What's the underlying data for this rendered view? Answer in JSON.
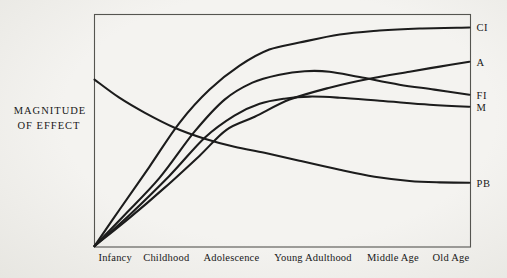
{
  "figure": {
    "bg_color": "#f3f2ef",
    "curve_color": "#1c1c1c",
    "box_color": "#555550",
    "text_color": "#181818"
  },
  "y_axis": {
    "line1": "MAGNITUDE",
    "line2": "OF EFFECT"
  },
  "x_axis": {
    "labels": [
      {
        "text": "Infancy",
        "x": 5.5
      },
      {
        "text": "Childhood",
        "x": 19.1
      },
      {
        "text": "Adolescence",
        "x": 36.4
      },
      {
        "text": "Young Adulthood",
        "x": 58.1
      },
      {
        "text": "Middle Age",
        "x": 79.4
      },
      {
        "text": "Old Age",
        "x": 94.8
      }
    ]
  },
  "chart_data": {
    "type": "line",
    "title": "",
    "ylabel": "MAGNITUDE OF EFFECT",
    "x_categories": [
      "Infancy",
      "Childhood",
      "Adolescence",
      "Young Adulthood",
      "Middle Age",
      "Old Age"
    ],
    "axes_numeric": false,
    "x_range": [
      0,
      100
    ],
    "y_range": [
      0,
      100
    ],
    "x_note": "0-100 = relative position across the life span (Infancy to Old Age)",
    "y_note": "0-100 = relative magnitude of effect (no numeric scale printed)",
    "grid": false,
    "legend_position": "curve-end labels at right margin",
    "series": [
      {
        "name": "CI",
        "points": [
          [
            0,
            0.4
          ],
          [
            6.6,
            15.9
          ],
          [
            14.6,
            34.5
          ],
          [
            22.6,
            53.4
          ],
          [
            30.6,
            67.7
          ],
          [
            38.6,
            78.0
          ],
          [
            46.5,
            84.9
          ],
          [
            54.5,
            87.9
          ],
          [
            65.2,
            91.4
          ],
          [
            75.8,
            93.1
          ],
          [
            86.4,
            94.0
          ],
          [
            99.7,
            94.4
          ]
        ]
      },
      {
        "name": "A",
        "points": [
          [
            0,
            0.4
          ],
          [
            9.3,
            12.5
          ],
          [
            18.6,
            25.4
          ],
          [
            27.9,
            39.2
          ],
          [
            35.1,
            50.4
          ],
          [
            42.6,
            56.0
          ],
          [
            51.9,
            63.4
          ],
          [
            62.5,
            68.5
          ],
          [
            73.1,
            72.4
          ],
          [
            83.8,
            75.4
          ],
          [
            91.8,
            77.6
          ],
          [
            99.7,
            79.7
          ]
        ]
      },
      {
        "name": "FI",
        "points": [
          [
            0,
            0.4
          ],
          [
            8.0,
            13.8
          ],
          [
            17.3,
            29.7
          ],
          [
            26.6,
            49.6
          ],
          [
            34.6,
            63.4
          ],
          [
            42.0,
            70.7
          ],
          [
            49.2,
            74.1
          ],
          [
            55.9,
            75.6
          ],
          [
            62.5,
            75.4
          ],
          [
            70.5,
            73.1
          ],
          [
            81.1,
            69.8
          ],
          [
            90.4,
            67.7
          ],
          [
            99.7,
            65.5
          ]
        ]
      },
      {
        "name": "M",
        "points": [
          [
            0,
            0.4
          ],
          [
            9.3,
            13.8
          ],
          [
            19.9,
            30.6
          ],
          [
            29.3,
            47.0
          ],
          [
            37.2,
            56.5
          ],
          [
            43.9,
            61.6
          ],
          [
            50.5,
            63.8
          ],
          [
            57.2,
            64.7
          ],
          [
            65.2,
            64.2
          ],
          [
            75.8,
            62.9
          ],
          [
            89.1,
            61.2
          ],
          [
            99.7,
            60.3
          ]
        ]
      },
      {
        "name": "PB",
        "points": [
          [
            0,
            72.0
          ],
          [
            6.6,
            64.2
          ],
          [
            13.3,
            57.8
          ],
          [
            21.3,
            51.3
          ],
          [
            29.3,
            46.6
          ],
          [
            37.2,
            43.1
          ],
          [
            45.2,
            40.5
          ],
          [
            54.5,
            37.1
          ],
          [
            65.2,
            33.2
          ],
          [
            74.5,
            30.2
          ],
          [
            83.8,
            28.4
          ],
          [
            91.8,
            27.8
          ],
          [
            99.7,
            27.6
          ]
        ]
      }
    ]
  }
}
